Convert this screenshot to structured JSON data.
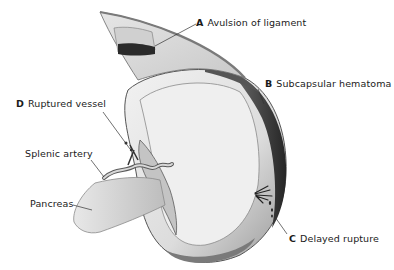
{
  "figure": {
    "labels": [
      {
        "id": "A",
        "letter": "A",
        "text": "Avulsion of ligament"
      },
      {
        "id": "B",
        "letter": "B",
        "text": "Subcapsular hematoma"
      },
      {
        "id": "C",
        "letter": "C",
        "text": "Delayed rupture"
      },
      {
        "id": "D",
        "letter": "D",
        "text": "Ruptured vessel"
      },
      {
        "id": "splenic-artery",
        "letter": "",
        "text": "Splenic artery"
      },
      {
        "id": "pancreas",
        "letter": "",
        "text": "Pancreas"
      }
    ]
  },
  "colors": {
    "background": "#ffffff",
    "tissue_light": "#e4e4e4",
    "tissue_mid": "#b8b8b8",
    "tissue_dark": "#4a4a4a",
    "hematoma": "#2e2e2e",
    "text": "#1a1a1a"
  }
}
